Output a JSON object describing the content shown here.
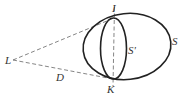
{
  "diagram": {
    "colors": {
      "stroke": "#222222",
      "dashed": "#555555",
      "label": "#333333",
      "background": "#ffffff"
    },
    "points": {
      "L": {
        "label": "L",
        "x": 12,
        "y": 60
      },
      "I": {
        "label": "I",
        "x": 114,
        "y": 18
      },
      "K": {
        "label": "K",
        "x": 113,
        "y": 79
      }
    },
    "shapes": {
      "S": {
        "label": "S",
        "type": "ellipse",
        "cx": 127,
        "cy": 46.5,
        "rx": 44,
        "ry": 33
      },
      "S_prime": {
        "label": "S'",
        "type": "ellipse",
        "cx": 113.5,
        "cy": 48.5,
        "rx": 13,
        "ry": 30.5
      }
    },
    "segments": [
      {
        "name": "L-I",
        "style": "dashed"
      },
      {
        "name": "L-K",
        "style": "dashed",
        "label": "D"
      },
      {
        "name": "I-K",
        "style": "dashed"
      }
    ],
    "labels": {
      "L": "L",
      "I": "I",
      "K": "K",
      "S": "S",
      "S_prime": "S'",
      "D": "D"
    }
  }
}
